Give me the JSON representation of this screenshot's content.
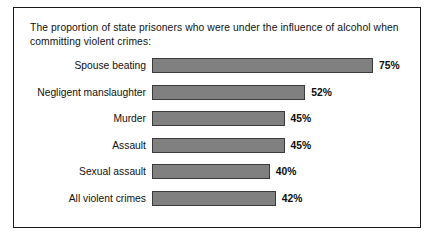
{
  "figure": {
    "caption": "The proportion of state prisoners who were under the influence of alcohol when committing violent crimes:",
    "border_color": "#1a1a1a",
    "background_color": "#ffffff"
  },
  "chart_data": {
    "type": "bar",
    "orientation": "horizontal",
    "title": "The proportion of state prisoners who were under the influence of alcohol when committing violent crimes:",
    "xlabel": "",
    "ylabel": "",
    "xlim": [
      0,
      75
    ],
    "grid": false,
    "legend": false,
    "value_suffix": "%",
    "bar_color": "#808080",
    "bar_border_color": "#3a3a3a",
    "categories": [
      "Spouse beating",
      "Negligent manslaughter",
      "Murder",
      "Assault",
      "Sexual assault",
      "All violent crimes"
    ],
    "values": [
      75,
      52,
      45,
      45,
      40,
      42
    ],
    "value_labels": [
      "75%",
      "52%",
      "45%",
      "45%",
      "40%",
      "42%"
    ]
  }
}
